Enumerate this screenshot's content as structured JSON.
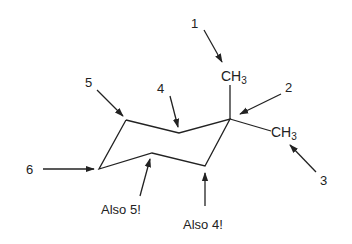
{
  "diagram": {
    "type": "chemical-structure",
    "molecule": "1,1-dimethylcyclohexane (chair conformation)",
    "substituents": {
      "top": {
        "text": "CH",
        "sub": "3"
      },
      "right": {
        "text": "CH",
        "sub": "3"
      }
    },
    "labels": {
      "l1": "1",
      "l2": "2",
      "l3": "3",
      "l4": "4",
      "l5": "5",
      "l6": "6",
      "also5": "Also 5!",
      "also4": "Also 4!"
    },
    "colors": {
      "line": "#222222",
      "background": "#ffffff"
    }
  }
}
